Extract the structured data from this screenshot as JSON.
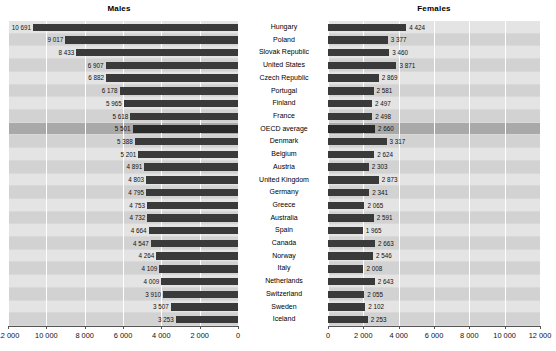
{
  "header": {
    "panel_males": "Males",
    "panel_females": "Females"
  },
  "chart_data": {
    "type": "bar",
    "title": "",
    "subtype": "paired-horizontal-pyramid",
    "categories": [
      "Hungary",
      "Poland",
      "Slovak Republic",
      "United States",
      "Czech Republic",
      "Portugal",
      "Finland",
      "France",
      "OECD average",
      "Denmark",
      "Belgium",
      "Austria",
      "United Kingdom",
      "Germany",
      "Greece",
      "Australia",
      "Spain",
      "Canada",
      "Norway",
      "Italy",
      "Netherlands",
      "Switzerland",
      "Sweden",
      "Iceland"
    ],
    "series": [
      {
        "name": "Males",
        "direction": "left",
        "values": [
          10691,
          9017,
          8433,
          6907,
          6882,
          6178,
          5965,
          5618,
          5501,
          5388,
          5201,
          4891,
          4803,
          4795,
          4753,
          4732,
          4664,
          4547,
          4264,
          4109,
          4009,
          3910,
          3507,
          3253
        ],
        "labels": [
          "10 691",
          "9 017",
          "8 433",
          "6 907",
          "6 882",
          "6 178",
          "5 965",
          "5 618",
          "5 501",
          "5 388",
          "5 201",
          "4 891",
          "4 803",
          "4 795",
          "4 753",
          "4 732",
          "4 664",
          "4 547",
          "4 264",
          "4 109",
          "4 009",
          "3 910",
          "3 507",
          "3 253"
        ]
      },
      {
        "name": "Females",
        "direction": "right",
        "values": [
          4424,
          3377,
          3460,
          3871,
          2869,
          2581,
          2497,
          2498,
          2660,
          3317,
          2624,
          2303,
          2873,
          2341,
          2065,
          2591,
          1965,
          2663,
          2546,
          2008,
          2643,
          2055,
          2102,
          2253
        ],
        "labels": [
          "4 424",
          "3 377",
          "3 460",
          "3 871",
          "2 869",
          "2 581",
          "2 497",
          "2 498",
          "2 660",
          "3 317",
          "2 624",
          "2 303",
          "2 873",
          "2 341",
          "2 065",
          "2 591",
          "1 965",
          "2 663",
          "2 546",
          "2 008",
          "2 643",
          "2 055",
          "2 102",
          "2 253"
        ]
      }
    ],
    "highlight_category": "OECD average",
    "xlim": [
      0,
      12000
    ],
    "xticks": [
      0,
      2000,
      4000,
      6000,
      8000,
      10000,
      12000
    ],
    "xticklabels_males": [
      "12 000",
      "10 000",
      "8 000",
      "6 000",
      "4 000",
      "2 000",
      "0"
    ],
    "xticklabels_females": [
      "0",
      "2 000",
      "4 000",
      "6 000",
      "8 000",
      "10 000",
      "12 000"
    ],
    "xlabel": "",
    "ylabel": "",
    "grid": true,
    "legend": "none"
  },
  "colors": {
    "bar": "#3a3a3a",
    "plot_background": "#d9d9d9",
    "band_light": "#e4e4e4",
    "band_dark": "#d2d2d2",
    "band_highlight": "#a9a9a9",
    "gridline": "#ffffff",
    "axis": "#555555",
    "text": "#000000"
  }
}
